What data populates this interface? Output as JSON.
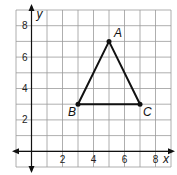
{
  "chart_data": {
    "type": "scatter",
    "title": "",
    "xlabel": "x",
    "ylabel": "y",
    "xlim": [
      -1,
      9
    ],
    "ylim": [
      -1,
      9
    ],
    "grid": true,
    "x_ticks": [
      "2",
      "4",
      "6",
      "8"
    ],
    "y_ticks": [
      "2",
      "4",
      "6",
      "8"
    ],
    "points": [
      {
        "label": "A",
        "x": 5,
        "y": 7
      },
      {
        "label": "B",
        "x": 3,
        "y": 3
      },
      {
        "label": "C",
        "x": 7,
        "y": 3
      }
    ],
    "polygon": [
      "A",
      "B",
      "C"
    ]
  }
}
